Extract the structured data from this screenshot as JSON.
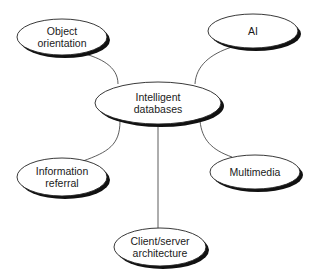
{
  "diagram": {
    "type": "mind-map",
    "center": {
      "id": "intelligent-databases",
      "lines": [
        "Intelligent",
        "databases"
      ],
      "cx": 158,
      "cy": 103,
      "rx": 63,
      "ry": 21
    },
    "nodes": [
      {
        "id": "object-orientation",
        "lines": [
          "Object",
          "orientation"
        ],
        "cx": 62,
        "cy": 37,
        "rx": 45,
        "ry": 18
      },
      {
        "id": "ai",
        "lines": [
          "AI"
        ],
        "cx": 253,
        "cy": 31,
        "rx": 45,
        "ry": 17
      },
      {
        "id": "information-referral",
        "lines": [
          "Information",
          "referral"
        ],
        "cx": 62,
        "cy": 177,
        "rx": 45,
        "ry": 19
      },
      {
        "id": "multimedia",
        "lines": [
          "Multimedia"
        ],
        "cx": 255,
        "cy": 172,
        "rx": 45,
        "ry": 17
      },
      {
        "id": "client-server-architecture",
        "lines": [
          "Client/server",
          "architecture"
        ],
        "cx": 160,
        "cy": 247,
        "rx": 46,
        "ry": 19
      }
    ],
    "edges": [
      {
        "from": "intelligent-databases",
        "to": "object-orientation"
      },
      {
        "from": "intelligent-databases",
        "to": "ai"
      },
      {
        "from": "intelligent-databases",
        "to": "information-referral"
      },
      {
        "from": "intelligent-databases",
        "to": "multimedia"
      },
      {
        "from": "intelligent-databases",
        "to": "client-server-architecture"
      }
    ],
    "colors": {
      "stroke": "#222222",
      "shadow": "#111111",
      "fill": "#ffffff",
      "text": "#1a1a1a"
    }
  }
}
